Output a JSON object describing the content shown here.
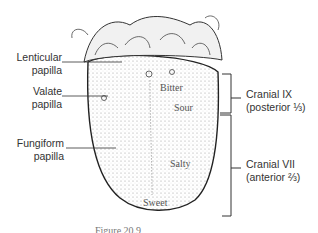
{
  "labels": {
    "lenticular": [
      "Lenticular",
      "papilla"
    ],
    "valate": [
      "Valate",
      "papilla"
    ],
    "fungiform": [
      "Fungiform",
      "papilla"
    ]
  },
  "tastes": {
    "bitter": "Bitter",
    "sour": "Sour",
    "salty": "Salty",
    "sweet": "Sweet"
  },
  "nerves": {
    "posterior": {
      "name": "Cranial IX",
      "region": "(posterior ⅓)"
    },
    "anterior": {
      "name": "Cranial VII",
      "region": "(anterior ⅔)"
    }
  },
  "caption": "Figure 20.9"
}
